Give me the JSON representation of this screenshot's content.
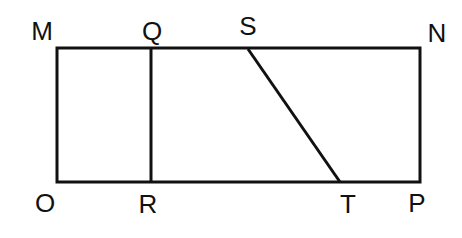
{
  "figure": {
    "background_color": "#ffffff",
    "stroke_color": "#111111",
    "stroke_width": 3,
    "label_color": "#111111",
    "label_font_size": 26
  },
  "labels": {
    "m": "M",
    "q": "Q",
    "s": "S",
    "n": "N",
    "o": "O",
    "r": "R",
    "t": "T",
    "p": "P"
  },
  "geometry": {
    "rectangle": {
      "name": "MNPO",
      "left": 57,
      "top": 48,
      "right": 420,
      "bottom": 182,
      "width": 363,
      "height": 134
    },
    "segment_qr": {
      "name": "QR",
      "x1": 151,
      "y1": 48,
      "x2": 151,
      "y2": 182,
      "orientation": "vertical"
    },
    "segment_st": {
      "name": "ST",
      "x1": 248,
      "y1": 49,
      "x2": 340,
      "y2": 182,
      "orientation": "diagonal"
    },
    "points": {
      "M": {
        "x": 57,
        "y": 48,
        "label_x": 42,
        "label_y": 31
      },
      "Q": {
        "x": 151,
        "y": 48,
        "label_x": 152,
        "label_y": 31
      },
      "S": {
        "x": 248,
        "y": 48,
        "label_x": 248,
        "label_y": 26
      },
      "N": {
        "x": 420,
        "y": 48,
        "label_x": 437,
        "label_y": 33
      },
      "O": {
        "x": 57,
        "y": 182,
        "label_x": 45,
        "label_y": 203
      },
      "R": {
        "x": 151,
        "y": 182,
        "label_x": 148,
        "label_y": 204
      },
      "T": {
        "x": 340,
        "y": 182,
        "label_x": 348,
        "label_y": 204
      },
      "P": {
        "x": 420,
        "y": 182,
        "label_x": 417,
        "label_y": 203
      }
    }
  }
}
